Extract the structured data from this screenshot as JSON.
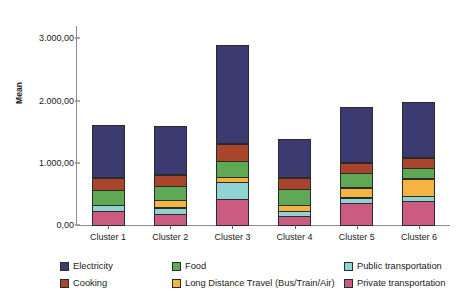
{
  "chart_data": {
    "type": "bar",
    "subtype": "stacked-bar",
    "title": "",
    "xlabel": "",
    "ylabel": "Mean",
    "ylim": [
      0,
      3200
    ],
    "yticks": [
      0,
      1000,
      2000,
      3000
    ],
    "ytick_labels": [
      "0,00",
      "1.000,00",
      "2.000,00",
      "3.000,00"
    ],
    "grid": false,
    "legend_position": "bottom",
    "number_format": "european (dot thousands, comma decimal)",
    "categories": [
      "Cluster 1",
      "Cluster 2",
      "Cluster 3",
      "Cluster 4",
      "Cluster 5",
      "Cluster 6"
    ],
    "series": [
      {
        "name": "Private transportation",
        "color": "#cb5b81",
        "values": [
          240,
          190,
          435,
          160,
          370,
          400
        ]
      },
      {
        "name": "Public transportation",
        "color": "#8fd3d3",
        "values": [
          110,
          115,
          275,
          85,
          95,
          95
        ]
      },
      {
        "name": "Long Distance Travel (Bus/Train/Air)",
        "color": "#f5b342",
        "values": [
          0,
          130,
          100,
          120,
          175,
          290
        ]
      },
      {
        "name": "Food",
        "color": "#5fa855",
        "values": [
          255,
          245,
          270,
          260,
          240,
          185
        ]
      },
      {
        "name": "Cooking",
        "color": "#a8452c",
        "values": [
          195,
          185,
          290,
          190,
          180,
          165
        ]
      },
      {
        "name": "Electricity",
        "color": "#3b3b72",
        "values": [
          855,
          795,
          1595,
          625,
          895,
          900
        ]
      }
    ],
    "totals": [
      1655,
      1660,
      2965,
      1440,
      1955,
      2035
    ]
  },
  "legend": {
    "entries": [
      {
        "label": "Electricity",
        "color": "#3b3b72"
      },
      {
        "label": "Food",
        "color": "#5fa855"
      },
      {
        "label": "Public transportation",
        "color": "#8fd3d3"
      },
      {
        "label": "Cooking",
        "color": "#a8452c"
      },
      {
        "label": "Long Distance Travel (Bus/Train/Air)",
        "color": "#f5b342"
      },
      {
        "label": "Private transportation",
        "color": "#cb5b81"
      }
    ]
  }
}
